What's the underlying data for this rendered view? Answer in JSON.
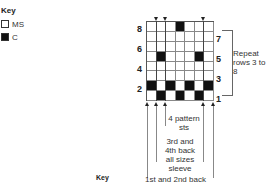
{
  "key": {
    "title": "Key",
    "items": [
      {
        "label": "MS",
        "filled": false
      },
      {
        "label": "C",
        "filled": true
      }
    ]
  },
  "chart": {
    "columns": 7,
    "rows": 8,
    "row_labels_left": [
      "8",
      "6",
      "4",
      "2"
    ],
    "row_labels_right": [
      "7",
      "5",
      "3",
      "1"
    ],
    "filled_cells": {
      "row8": [
        4
      ],
      "row5": [
        2,
        6
      ],
      "row2": [
        1,
        3,
        5,
        7
      ],
      "row1": [
        2,
        4,
        6
      ]
    },
    "repeat_label": "Repeat rows 3 to 8",
    "repeat_line1": "Repeat",
    "repeat_line2": "rows 3 to 8",
    "annotations": {
      "pattern_line1": "4 pattern",
      "pattern_line2": "sts",
      "sleeve_line1": "3rd and",
      "sleeve_line2": "4th back",
      "sleeve_line3": "all sizes",
      "sleeve_line4": "sleeve",
      "back": "1st and 2nd back"
    }
  },
  "bottom_key": "Key"
}
